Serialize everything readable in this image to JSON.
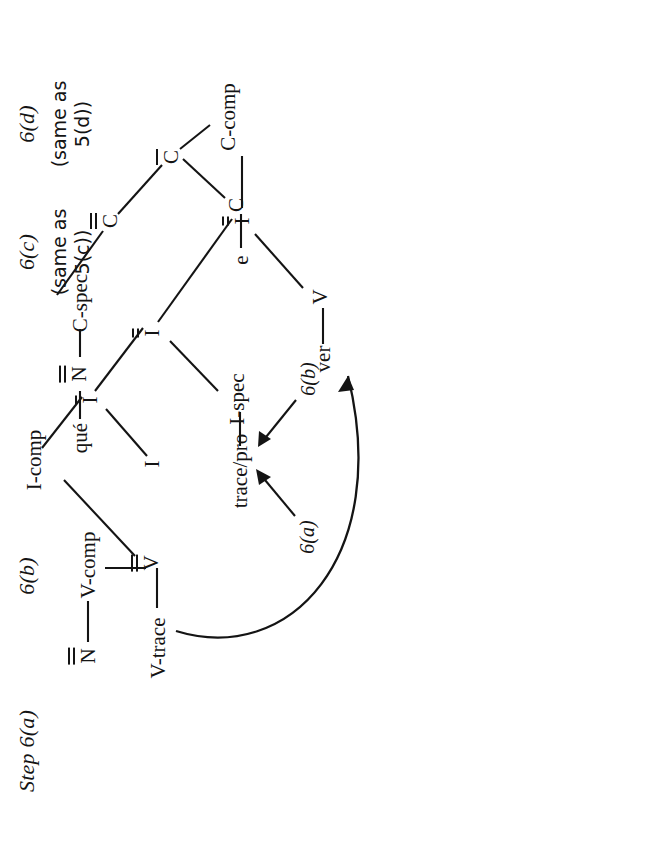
{
  "figure": {
    "step_caption": "Step 6(a)",
    "panel_labels": {
      "b": "6(b)",
      "c": "6(c)",
      "d": "6(d)"
    },
    "same_as_c_line1": "(same as",
    "same_as_c_line2": "5(c))",
    "same_as_d_line1": "(same as",
    "same_as_d_line2": "5(d))",
    "annotation_a": "6(a)",
    "annotation_b": "6(b)"
  },
  "tree": {
    "nodes": {
      "cp": {
        "base": "C",
        "bars": 2
      },
      "c_spec": {
        "base": "C-spec",
        "bars": 0
      },
      "c_bar": {
        "base": "C",
        "bars": 1
      },
      "c_head": {
        "base": "C",
        "bars": 0
      },
      "c_comp": {
        "base": "C-comp",
        "bars": 0
      },
      "n_spec": {
        "base": "N",
        "bars": 2
      },
      "que": {
        "base": "qué",
        "bars": 0
      },
      "e": {
        "base": "e",
        "bars": 0
      },
      "ip_top": {
        "base": "I",
        "bars": 2
      },
      "v_left": {
        "base": "V",
        "bars": 0
      },
      "ver": {
        "base": "ver",
        "bars": 0
      },
      "ip_low": {
        "base": "I",
        "bars": 2
      },
      "i_spec": {
        "base": "I-spec",
        "bars": 0
      },
      "trace_pro": {
        "base": "trace/pro",
        "bars": 0
      },
      "i_bar": {
        "base": "I",
        "bars": 1
      },
      "i_head": {
        "base": "I",
        "bars": 0
      },
      "i_comp": {
        "base": "I-comp",
        "bars": 0
      },
      "vp": {
        "base": "V",
        "bars": 2
      },
      "v_trace": {
        "base": "V-trace",
        "bars": 0
      },
      "v_comp": {
        "base": "V-comp",
        "bars": 0
      },
      "n_obj": {
        "base": "N",
        "bars": 2
      }
    },
    "movement_arrow": {
      "from": "V-trace",
      "to": "ver"
    },
    "pointer_arrows": [
      {
        "label": "6(a)",
        "target": "trace/pro"
      },
      {
        "label": "6(b)",
        "target": "trace/pro"
      }
    ]
  },
  "colors": {
    "ink": "#141414",
    "paper": "#ffffff"
  }
}
